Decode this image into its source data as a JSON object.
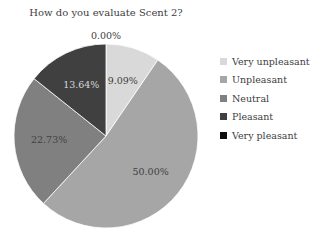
{
  "chart_data": {
    "type": "pie",
    "title": "How do you evaluate Scent 2?",
    "categories": [
      "Very unpleasant",
      "Unpleasant",
      "Neutral",
      "Pleasant",
      "Very pleasant"
    ],
    "values": [
      9.09,
      50.0,
      22.73,
      13.64,
      0.0
    ],
    "labels": [
      "9.09%",
      "50.00%",
      "22.73%",
      "13.64%",
      "0.00%"
    ],
    "colors": [
      "#d9d9d9",
      "#a6a6a6",
      "#808080",
      "#404040",
      "#0d0d0d"
    ],
    "label_colors": [
      "#404040",
      "#404040",
      "#404040",
      "#d9d9d9",
      "#404040"
    ],
    "legend_position": "right",
    "start_angle_deg": 0,
    "direction": "clockwise"
  }
}
